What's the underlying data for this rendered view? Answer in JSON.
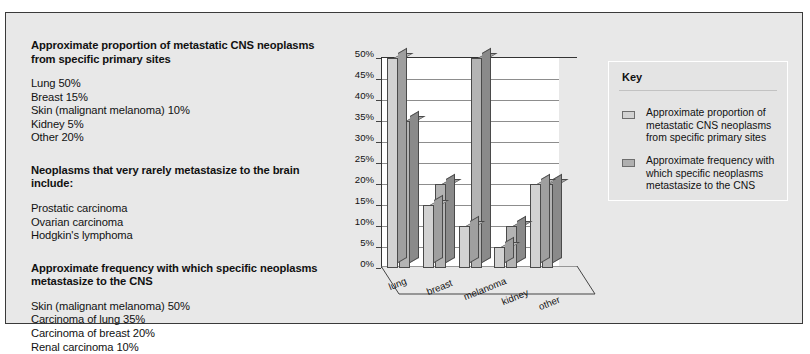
{
  "figure": {
    "sections": [
      {
        "id": "proportion",
        "heading_line1": "Approximate proportion of metastatic CNS neoplasms",
        "heading_line2": "from specific primary sites",
        "items": [
          "Lung 50%",
          "Breast 15%",
          "Skin (malignant melanoma) 10%",
          "Kidney 5%",
          "Other 20%"
        ]
      },
      {
        "id": "rare",
        "heading_line1": "Neoplasms that very rarely metastasize to the  brain include:",
        "heading_line2": "",
        "items": [
          "Prostatic carcinoma",
          "Ovarian carcinoma",
          "Hodgkin's lymphoma"
        ]
      },
      {
        "id": "frequency",
        "heading_line1": "Approximate frequency with which specific neoplasms",
        "heading_line2": "metastasize to the CNS",
        "items": [
          "Skin (malignant melanoma) 50%",
          "Carcinoma of lung  35%",
          "Carcinoma of breast 20%",
          "Renal carcinoma 10%"
        ]
      }
    ]
  },
  "key": {
    "title": "Key",
    "entries": [
      {
        "swatch": "light-gray",
        "label": "Approximate proportion of metastatic CNS neoplasms from specific primary sites"
      },
      {
        "swatch": "medium-gray",
        "label": "Approximate frequency with which specific neoplasms metastasize to the CNS"
      }
    ]
  },
  "chart_data": {
    "type": "bar",
    "title": "",
    "xlabel": "",
    "ylabel": "",
    "categories": [
      "lung",
      "breast",
      "melanoma",
      "kidney",
      "other"
    ],
    "series": [
      {
        "name": "Approximate proportion of metastatic CNS neoplasms from specific primary sites",
        "color": "#d2d2d2",
        "values": [
          50,
          15,
          10,
          5,
          20
        ]
      },
      {
        "name": "Approximate frequency with which specific neoplasms metastasize to the CNS",
        "color": "#b4b4b4",
        "values": [
          35,
          20,
          50,
          10,
          20
        ]
      }
    ],
    "ylim": [
      0,
      50
    ],
    "ytick_labels": [
      "50%",
      "45%",
      "40%",
      "35%",
      "30%",
      "25%",
      "20%",
      "15%",
      "10%",
      "5%",
      "0%"
    ],
    "ytick_values": [
      50,
      45,
      40,
      35,
      30,
      25,
      20,
      15,
      10,
      5,
      0
    ],
    "grid": true,
    "legend_position": "right",
    "style": "3d-column"
  }
}
